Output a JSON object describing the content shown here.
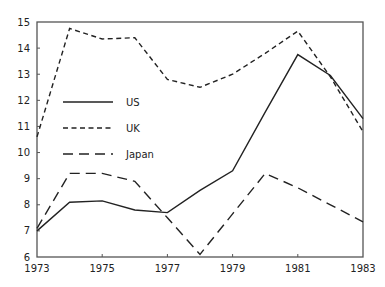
{
  "chart_data": {
    "type": "line",
    "title": "",
    "xlabel": "",
    "ylabel": "",
    "x": [
      1973,
      1974,
      1975,
      1976,
      1977,
      1978,
      1979,
      1980,
      1981,
      1982,
      1983
    ],
    "xlim": [
      1973,
      1983
    ],
    "ylim": [
      6,
      15
    ],
    "xticks": [
      1973,
      1975,
      1977,
      1979,
      1981,
      1983
    ],
    "yticks": [
      6,
      7,
      8,
      9,
      10,
      11,
      12,
      13,
      14,
      15
    ],
    "grid": false,
    "legend_position": "center-left",
    "series": [
      {
        "name": "US",
        "style": "solid",
        "values": [
          7.0,
          8.1,
          8.15,
          7.8,
          7.7,
          8.55,
          9.3,
          11.55,
          13.75,
          12.95,
          11.3
        ]
      },
      {
        "name": "UK",
        "style": "dotted-dash",
        "values": [
          10.6,
          14.75,
          14.35,
          14.4,
          12.8,
          12.5,
          13.0,
          13.8,
          14.65,
          12.9,
          10.8
        ]
      },
      {
        "name": "Japan",
        "style": "long-dash",
        "values": [
          7.1,
          9.2,
          9.2,
          8.9,
          7.5,
          6.1,
          7.65,
          9.2,
          8.65,
          8.0,
          7.35
        ]
      }
    ]
  }
}
